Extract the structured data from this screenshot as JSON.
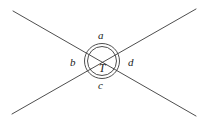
{
  "figure": {
    "type": "geometry-diagram",
    "background_color": "#ffffff",
    "stroke_color": "#3a3a3a",
    "label_color": "#1a1a1a",
    "canvas": {
      "width": 204,
      "height": 125
    },
    "intersection_point": {
      "x": 102,
      "y": 61
    },
    "circles": [
      {
        "name": "outer-circle",
        "cx": 102,
        "cy": 61,
        "r": 17.5
      },
      {
        "name": "inner-circle",
        "cx": 102,
        "cy": 61,
        "r": 14.5
      }
    ],
    "lines": [
      {
        "name": "line-nw-se",
        "x1": 13,
        "y1": 11,
        "x2": 196,
        "y2": 116
      },
      {
        "name": "line-sw-ne",
        "x1": 12,
        "y1": 114,
        "x2": 196,
        "y2": 9
      }
    ],
    "labels": {
      "top": "a",
      "left": "b",
      "bottom": "c",
      "right": "d",
      "center": "T"
    }
  }
}
